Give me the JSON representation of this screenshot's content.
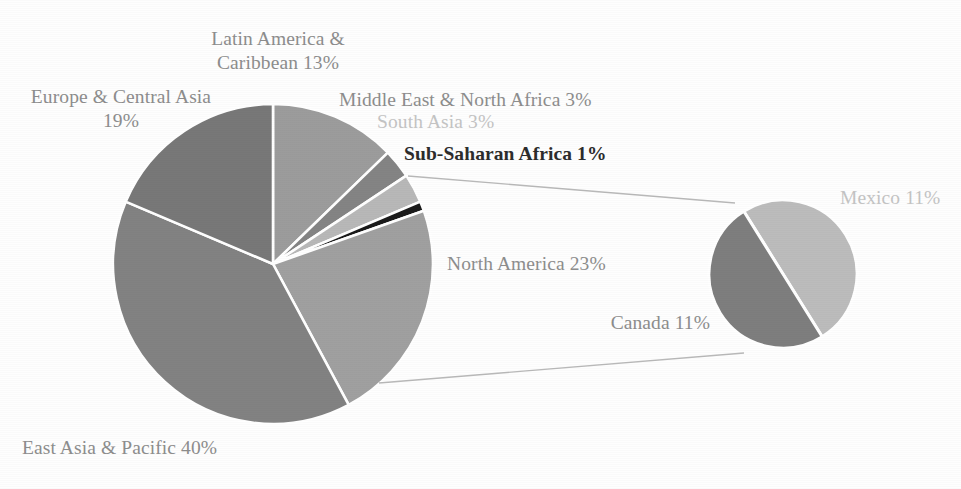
{
  "chart_data": {
    "type": "pie",
    "title": "",
    "subtitle": "",
    "xlabel": "",
    "ylabel": "",
    "legend_position": "none",
    "grid": false,
    "main_pie": {
      "name": "Regional shares",
      "center": [
        273,
        264
      ],
      "radius": 160,
      "start_angle_deg": -90,
      "direction": "clockwise",
      "categories": [
        "Latin America & Caribbean",
        "Middle East & North Africa",
        "South Asia",
        "Sub-Saharan Africa",
        "North America",
        "East Asia & Pacific",
        "Europe & Central Asia"
      ],
      "values": [
        13,
        3,
        3,
        1,
        23,
        40,
        19
      ],
      "colors": [
        "#9c9c9c",
        "#848484",
        "#b8b8b8",
        "#1a1a1a",
        "#a0a0a0",
        "#828282",
        "#787878"
      ]
    },
    "exploded_pie": {
      "name": "North America breakdown",
      "parent_category": "North America",
      "center": [
        783,
        274
      ],
      "radius": 74,
      "categories": [
        "Mexico",
        "Canada"
      ],
      "values": [
        11,
        11
      ],
      "colors": [
        "#bcbcbc",
        "#7e7e7e"
      ]
    },
    "labels": [
      {
        "key": "latin_america",
        "text": "Latin America &\nCaribbean 13%",
        "value": 13,
        "style": "main",
        "align": "center"
      },
      {
        "key": "europe",
        "text": "Europe & Central Asia\n19%",
        "value": 19,
        "style": "main",
        "align": "center"
      },
      {
        "key": "middle_east",
        "text": "Middle East & North Africa 3%",
        "value": 3,
        "style": "main",
        "align": "left"
      },
      {
        "key": "south_asia",
        "text": "South Asia 3%",
        "value": 3,
        "style": "faint",
        "align": "left"
      },
      {
        "key": "sub_saharan",
        "text": "Sub-Saharan Africa 1%",
        "value": 1,
        "style": "dark",
        "align": "left"
      },
      {
        "key": "north_america",
        "text": "North America 23%",
        "value": 23,
        "style": "main",
        "align": "left"
      },
      {
        "key": "east_asia",
        "text": "East Asia & Pacific 40%",
        "value": 40,
        "style": "main",
        "align": "left"
      },
      {
        "key": "mexico",
        "text": "Mexico 11%",
        "value": 11,
        "style": "faint",
        "align": "left"
      },
      {
        "key": "canada",
        "text": "Canada 11%",
        "value": 11,
        "style": "main",
        "align": "right"
      }
    ]
  },
  "labels": {
    "latin_america": "Latin America &\nCaribbean 13%",
    "europe": "Europe & Central Asia\n19%",
    "middle_east": "Middle East & North Africa 3%",
    "south_asia": "South Asia 3%",
    "sub_saharan": "Sub-Saharan Africa 1%",
    "north_america": "North America 23%",
    "east_asia": "East Asia & Pacific 40%",
    "mexico": "Mexico 11%",
    "canada": "Canada 11%"
  },
  "colors": {
    "background": "#fefefe",
    "label_text": "#8d8d8d",
    "label_text_dark": "#2c2c2c",
    "label_text_faint": "#c4c4c4",
    "leader_line": "#b9b9b9",
    "slice_divider": "#ffffff"
  }
}
